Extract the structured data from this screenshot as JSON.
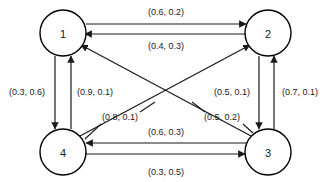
{
  "figure": {
    "type": "directed-weighted-graph",
    "background_color": "#ffffff",
    "line_color": "#1a1a1a",
    "node_fill": "#ffffff"
  },
  "nodes": [
    {
      "id": "1",
      "label": "1",
      "cx": 63,
      "cy": 33,
      "r": 23
    },
    {
      "id": "2",
      "label": "2",
      "cx": 268,
      "cy": 33,
      "r": 23
    },
    {
      "id": "3",
      "label": "3",
      "cx": 268,
      "cy": 152,
      "r": 23
    },
    {
      "id": "4",
      "label": "4",
      "cx": 63,
      "cy": 152,
      "r": 23
    }
  ],
  "edges": [
    {
      "id": "e1-2",
      "from": "1",
      "to": "2",
      "label": "(0.6, 0.2)",
      "label_x": 166,
      "label_y": 12
    },
    {
      "id": "e2-1",
      "from": "2",
      "to": "1",
      "label": "(0.4, 0.3)",
      "label_x": 166,
      "label_y": 45
    },
    {
      "id": "e1-4",
      "from": "1",
      "to": "4",
      "label": "(0.3, 0.6)",
      "label_x": 27,
      "label_y": 92
    },
    {
      "id": "e4-1",
      "from": "4",
      "to": "1",
      "label": "(0.9, 0.1)",
      "label_x": 95,
      "label_y": 92
    },
    {
      "id": "e2-3",
      "from": "2",
      "to": "3",
      "label": "(0.5, 0.1)",
      "label_x": 232,
      "label_y": 92
    },
    {
      "id": "e3-2",
      "from": "3",
      "to": "2",
      "label": "(0.7, 0.1)",
      "label_x": 300,
      "label_y": 92
    },
    {
      "id": "e3-4",
      "from": "3",
      "to": "4",
      "label": "(0.6, 0.3)",
      "label_x": 166,
      "label_y": 131
    },
    {
      "id": "e4-3",
      "from": "4",
      "to": "3",
      "label": "(0.3, 0.5)",
      "label_x": 166,
      "label_y": 172
    },
    {
      "id": "e4-2",
      "from": "4",
      "to": "2",
      "label": "(0.8, 0.1)",
      "label_x": 120,
      "label_y": 118
    },
    {
      "id": "e3-1",
      "from": "3",
      "to": "1",
      "label": "(0.5, 0.2)",
      "label_x": 222,
      "label_y": 118
    }
  ]
}
